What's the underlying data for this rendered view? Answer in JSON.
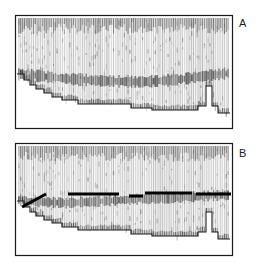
{
  "figure": {
    "type": "seismic-profile-pair",
    "background": "#ffffff",
    "ink": "#1a1a1a",
    "trace_color": "#6e6e6e",
    "reflector_color": "#000000",
    "width": 263,
    "height": 267
  },
  "panels": [
    {
      "id": "A",
      "label": "A",
      "label_x": 239,
      "label_y": 18,
      "frame": {
        "x": 15,
        "y": 15,
        "w": 217,
        "h": 113
      },
      "trace_band": {
        "x": 17,
        "y": 17,
        "w": 213,
        "h": 95
      },
      "n_traces": 116,
      "diffuse_reflector": {
        "description": "broad diffuse sub-bottom reflector band",
        "points": [
          [
            17,
            74
          ],
          [
            40,
            76
          ],
          [
            70,
            79
          ],
          [
            105,
            81
          ],
          [
            140,
            82
          ],
          [
            175,
            80
          ],
          [
            205,
            76
          ],
          [
            230,
            73
          ]
        ],
        "thickness": 9
      },
      "bottom_trace": {
        "description": "stepped seafloor return line",
        "points": [
          [
            17,
            74
          ],
          [
            24,
            74
          ],
          [
            24,
            80
          ],
          [
            30,
            80
          ],
          [
            30,
            85
          ],
          [
            36,
            85
          ],
          [
            36,
            89
          ],
          [
            44,
            89
          ],
          [
            44,
            93
          ],
          [
            52,
            93
          ],
          [
            52,
            97
          ],
          [
            62,
            97
          ],
          [
            62,
            100
          ],
          [
            78,
            100
          ],
          [
            78,
            104
          ],
          [
            131,
            104
          ],
          [
            131,
            108
          ],
          [
            152,
            108
          ],
          [
            152,
            110
          ],
          [
            198,
            110
          ],
          [
            198,
            106
          ],
          [
            206,
            106
          ],
          [
            206,
            86
          ],
          [
            212,
            86
          ],
          [
            212,
            106
          ],
          [
            218,
            106
          ],
          [
            218,
            113
          ],
          [
            230,
            113
          ]
        ]
      },
      "bold_segments": []
    },
    {
      "id": "B",
      "label": "B",
      "label_x": 239,
      "label_y": 148,
      "frame": {
        "x": 15,
        "y": 143,
        "w": 217,
        "h": 112
      },
      "trace_band": {
        "x": 17,
        "y": 145,
        "w": 213,
        "h": 95
      },
      "n_traces": 116,
      "diffuse_reflector": {
        "description": "broad diffuse sub-bottom reflector band",
        "points": [
          [
            17,
            200
          ],
          [
            40,
            202
          ],
          [
            70,
            203
          ],
          [
            105,
            201
          ],
          [
            140,
            199
          ],
          [
            175,
            198
          ],
          [
            205,
            196
          ],
          [
            230,
            195
          ]
        ],
        "thickness": 8
      },
      "bottom_trace": {
        "description": "stepped seafloor return line",
        "points": [
          [
            17,
            201
          ],
          [
            24,
            201
          ],
          [
            24,
            207
          ],
          [
            30,
            207
          ],
          [
            30,
            212
          ],
          [
            36,
            212
          ],
          [
            36,
            216
          ],
          [
            44,
            216
          ],
          [
            44,
            220
          ],
          [
            52,
            220
          ],
          [
            52,
            223
          ],
          [
            62,
            223
          ],
          [
            62,
            227
          ],
          [
            78,
            227
          ],
          [
            78,
            230
          ],
          [
            131,
            230
          ],
          [
            131,
            234
          ],
          [
            152,
            234
          ],
          [
            152,
            236
          ],
          [
            198,
            236
          ],
          [
            198,
            232
          ],
          [
            206,
            232
          ],
          [
            206,
            212
          ],
          [
            212,
            212
          ],
          [
            212,
            232
          ],
          [
            218,
            232
          ],
          [
            218,
            239
          ],
          [
            230,
            239
          ]
        ]
      },
      "bold_segments": [
        {
          "name": "diagonal-pick",
          "x1": 22,
          "y1": 207,
          "x2": 46,
          "y2": 194,
          "width": 3
        },
        {
          "name": "horizontal-pick-1",
          "x1": 68,
          "y1": 194,
          "x2": 119,
          "y2": 194,
          "width": 3
        },
        {
          "name": "horizontal-pick-2",
          "x1": 129,
          "y1": 196,
          "x2": 143,
          "y2": 196,
          "width": 3
        },
        {
          "name": "horizontal-pick-3",
          "x1": 145,
          "y1": 193,
          "x2": 192,
          "y2": 193,
          "width": 3
        },
        {
          "name": "horizontal-pick-4",
          "x1": 196,
          "y1": 194,
          "x2": 231,
          "y2": 194,
          "width": 3
        }
      ]
    }
  ]
}
